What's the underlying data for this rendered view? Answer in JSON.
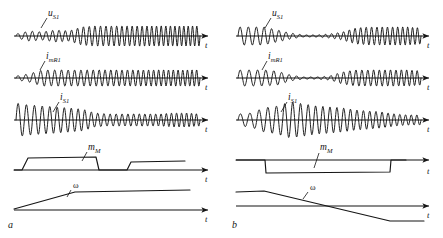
{
  "figure": {
    "type": "waveform-timing-diagram",
    "panels": [
      {
        "id": "a",
        "label": "a",
        "label_x": 8,
        "label_y": 228,
        "origin_x": 14,
        "width": 200,
        "signals": [
          {
            "name": "u_S1",
            "label_base": "u",
            "label_sub": "S1",
            "label_x": 48,
            "label_y": 16,
            "leader": "M 47 18 L 41 28",
            "axis_y": 36,
            "axis_x1": 14,
            "axis_x2": 208,
            "t_x": 205,
            "t_y": 48,
            "kind": "oscillation",
            "envelope": "low-start rising to steady high amplitude",
            "amp_profile": [
              2,
              5,
              4,
              6,
              5,
              9,
              10,
              10,
              10,
              10,
              10,
              10,
              10,
              10,
              10
            ],
            "cycles": 34,
            "amp_max": 11
          },
          {
            "name": "i_mR1",
            "label_base": "i",
            "label_sub": "mR1",
            "label_x": 46,
            "label_y": 59,
            "leader": "M 45 61 L 40 70",
            "axis_y": 78,
            "axis_x1": 14,
            "axis_x2": 208,
            "t_x": 205,
            "t_y": 90,
            "kind": "oscillation",
            "envelope": "small start then constant moderate amplitude",
            "amp_profile": [
              2,
              4,
              8,
              8,
              8,
              8,
              8,
              8,
              8,
              8,
              8,
              8,
              8,
              8,
              8
            ],
            "cycles": 32,
            "amp_max": 9
          },
          {
            "name": "i_S1",
            "label_base": "i",
            "label_sub": "S1",
            "label_x": 60,
            "label_y": 100,
            "leader": "M 59 102 L 53 112",
            "axis_y": 120,
            "axis_x1": 14,
            "axis_x2": 208,
            "t_x": 205,
            "t_y": 132,
            "kind": "oscillation",
            "envelope": "large decaying start then small steady ripple",
            "amp_profile": [
              17,
              15,
              14,
              13,
              12,
              11,
              7,
              6,
              6,
              6,
              6,
              6,
              7,
              7,
              6
            ],
            "cycles": 30,
            "amp_max": 18
          },
          {
            "name": "m_M",
            "label_base": "m",
            "label_sub": "M",
            "label_x": 88,
            "label_y": 150,
            "leader": "M 87 152 L 82 161",
            "axis_y": 170,
            "axis_x1": 14,
            "axis_x2": 208,
            "t_x": 205,
            "t_y": 182,
            "kind": "step",
            "shape": "rise to high plateau, fall to zero, later rise to lower plateau",
            "points": "14,170 22,170 28,158 96,157 99,170 127,170 131,162 185,161"
          },
          {
            "name": "omega",
            "label_base": "ω",
            "label_sub": "",
            "label_x": 73,
            "label_y": 188,
            "leader": "M 71 190 L 67 197",
            "axis_y": 210,
            "axis_x1": 14,
            "axis_x2": 208,
            "t_x": 205,
            "t_y": 222,
            "kind": "ramp",
            "shape": "linear ramp up then constant",
            "points": "14,209 75,192 190,190"
          }
        ]
      },
      {
        "id": "b",
        "label": "b",
        "label_x": 232,
        "label_y": 228,
        "origin_x": 236,
        "width": 200,
        "signals": [
          {
            "name": "u_S1",
            "label_base": "u",
            "label_sub": "S1",
            "label_x": 272,
            "label_y": 16,
            "leader": "M 271 18 L 265 28",
            "axis_y": 36,
            "axis_x1": 236,
            "axis_x2": 429,
            "t_x": 427,
            "t_y": 48,
            "kind": "oscillation",
            "envelope": "high, then near-zero gap, then high again",
            "amp_profile": [
              9,
              9,
              9,
              6,
              3,
              1,
              1,
              2,
              4,
              8,
              9,
              9,
              9,
              9,
              8
            ],
            "cycles": 30,
            "amp_max": 10
          },
          {
            "name": "i_mR1",
            "label_base": "i",
            "label_sub": "mR1",
            "label_x": 268,
            "label_y": 59,
            "leader": "M 267 61 L 262 70",
            "axis_y": 78,
            "axis_x1": 236,
            "axis_x2": 429,
            "t_x": 427,
            "t_y": 90,
            "kind": "oscillation",
            "envelope": "high, collapse to flat mid-section, then high again",
            "amp_profile": [
              8,
              8,
              8,
              7,
              3,
              1,
              1,
              2,
              6,
              8,
              8,
              8,
              8,
              8,
              7
            ],
            "cycles": 28,
            "amp_max": 9
          },
          {
            "name": "i_S1",
            "label_base": "i",
            "label_sub": "S1",
            "label_x": 288,
            "label_y": 100,
            "leader": "M 287 102 L 281 112",
            "axis_y": 120,
            "axis_x1": 236,
            "axis_x2": 429,
            "t_x": 427,
            "t_y": 132,
            "kind": "oscillation",
            "envelope": "ripple, then big slow swing, then ripple decaying",
            "amp_profile": [
              6,
              7,
              12,
              14,
              18,
              16,
              14,
              13,
              12,
              10,
              9,
              8,
              6,
              5,
              5
            ],
            "cycles": 26,
            "amp_max": 19
          },
          {
            "name": "m_M",
            "label_base": "m",
            "label_sub": "M",
            "label_x": 320,
            "label_y": 150,
            "leader": "M 319 153 L 314 168",
            "axis_y": 160,
            "axis_x1": 236,
            "axis_x2": 429,
            "t_x": 427,
            "t_y": 174,
            "kind": "step",
            "shape": "negative plateau between two zero levels",
            "points": "236,160 265,160 266,173 390,172 391,160 406,160"
          },
          {
            "name": "omega",
            "label_base": "ω",
            "label_sub": "",
            "label_x": 310,
            "label_y": 190,
            "leader": "M 308 192 L 303 199",
            "axis_y": 206,
            "axis_x1": 236,
            "axis_x2": 429,
            "t_x": 427,
            "t_y": 218,
            "kind": "ramp",
            "shape": "positive constant, linear ramp down through zero, negative constant",
            "points": "236,192 264,191 390,221 424,221"
          }
        ]
      }
    ],
    "axis_label_t": "t",
    "colors": {
      "ink": "#151515",
      "background": "#ffffff"
    }
  }
}
